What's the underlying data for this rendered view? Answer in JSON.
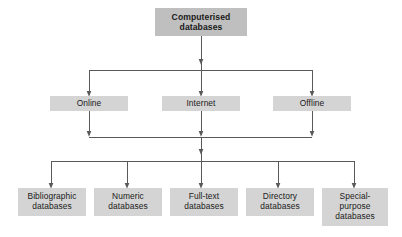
{
  "diagram": {
    "type": "tree",
    "title_node": {
      "id": "root",
      "label": "Computerised databases",
      "lines": [
        "Computerised",
        "databases"
      ],
      "bold": true,
      "fill": "#bfbfbf",
      "x": 155,
      "y": 8,
      "w": 92,
      "h": 28
    },
    "tier2": [
      {
        "id": "online",
        "label": "Online",
        "lines": [
          "Online"
        ],
        "fill": "#d4d4d4",
        "x": 50,
        "y": 96,
        "w": 78,
        "h": 15
      },
      {
        "id": "internet",
        "label": "Internet",
        "lines": [
          "Internet"
        ],
        "fill": "#d4d4d4",
        "x": 162,
        "y": 96,
        "w": 78,
        "h": 15
      },
      {
        "id": "offline",
        "label": "Offline",
        "lines": [
          "Offline"
        ],
        "fill": "#d4d4d4",
        "x": 273,
        "y": 96,
        "w": 78,
        "h": 15
      }
    ],
    "tier3": [
      {
        "id": "bibliographic",
        "label": "Bibliographic databases",
        "lines": [
          "Bibliographic",
          "databases"
        ],
        "fill": "#d4d4d4",
        "x": 18,
        "y": 188,
        "w": 68,
        "h": 28
      },
      {
        "id": "numeric",
        "label": "Numeric databases",
        "lines": [
          "Numeric",
          "databases"
        ],
        "fill": "#d4d4d4",
        "x": 94,
        "y": 188,
        "w": 68,
        "h": 28
      },
      {
        "id": "fulltext",
        "label": "Full-text databases",
        "lines": [
          "Full-text",
          "databases"
        ],
        "fill": "#d4d4d4",
        "x": 170,
        "y": 188,
        "w": 68,
        "h": 28
      },
      {
        "id": "directory",
        "label": "Directory databases",
        "lines": [
          "Directory",
          "databases"
        ],
        "fill": "#d4d4d4",
        "x": 246,
        "y": 188,
        "w": 68,
        "h": 28
      },
      {
        "id": "special-purpose",
        "label": "Special-purpose databases",
        "lines": [
          "Special-",
          "purpose",
          "databases"
        ],
        "fill": "#d4d4d4",
        "x": 322,
        "y": 188,
        "w": 66,
        "h": 38
      }
    ],
    "connector_color": "#595959",
    "background": "#ffffff"
  }
}
